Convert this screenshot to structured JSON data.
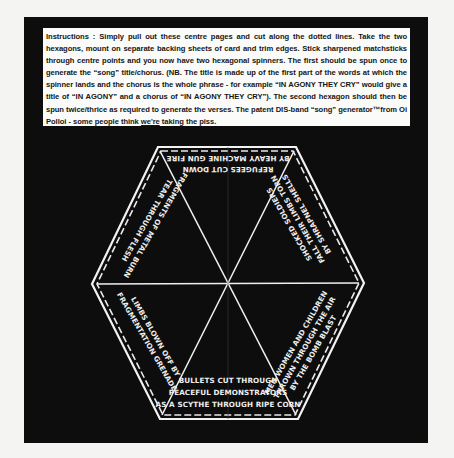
{
  "instructions": {
    "part1": "Instructions : Simply pull out these centre pages and cut along the dotted lines. Take the two hexagons, mount on separate backing sheets of card and trim edges. Stick sharpened matchsticks through centre points and you now have two hexagonal spinners. The first should be spun once to generate the “song” title/chorus. (NB. The title is made up of the first part of the words at which the spinner lands and the chorus is the whole phrase - for example “IN AGONY THEY CRY” would give a title of “IN AGONY” and a chorus of “IN AGONY THEY CRY”). The second hexagon should then be spun twice/thrice as required to generate the verses. The patent DIS-band “song” generator™from Oi Polloi - some people think ",
    "underlined": "we're",
    "part2": " taking the piss."
  },
  "spinner": {
    "label": "hexagonal-song-spinner",
    "colors": {
      "background": "#0d0d0d",
      "lines": "#f2f2f2",
      "text": "#eeeeee"
    },
    "segments": [
      {
        "position": "top",
        "lines": [
          "BY HEAVY MACHINE GUN FIRE",
          "REFUGEES CUT DOWN"
        ],
        "orientation": "upside-down"
      },
      {
        "position": "upper-right",
        "lines": [
          "SHOCKED SOLDIERS",
          "FALL THEIR LIMBS TORN",
          "BY SHRAPNEL SHELLS"
        ],
        "orientation": "rotated"
      },
      {
        "position": "lower-right",
        "lines": [
          "MEN WOMEN AND CHILDREN",
          "THROWN THROUGH THE AIR",
          "BY THE BOMB BLAST"
        ],
        "orientation": "rotated"
      },
      {
        "position": "bottom",
        "lines": [
          "BULLETS CUT THROUGH",
          "PEACEFUL DEMONSTRATORS",
          "AS A SCYTHE THROUGH RIPE CORN"
        ],
        "orientation": "upright"
      },
      {
        "position": "lower-left",
        "lines": [
          "LIMBS BLOWN OFF BY",
          "FRAGMENTATION GRENADE"
        ],
        "orientation": "rotated"
      },
      {
        "position": "upper-left",
        "lines": [
          "FRAGMENTS OF METAL BURN",
          "TEAR THROUGH FLESH"
        ],
        "orientation": "rotated"
      }
    ]
  }
}
